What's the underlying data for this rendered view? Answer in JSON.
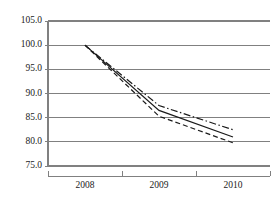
{
  "chart_data": {
    "type": "line",
    "title": "",
    "subtitle": "",
    "xlabel": "",
    "ylabel": "",
    "x": [
      "2008",
      "2009",
      "2010"
    ],
    "categories": [
      "2008",
      "2009",
      "2010"
    ],
    "series": [
      {
        "name": "upper",
        "style": "dash-dot",
        "values": [
          100.0,
          87.5,
          82.5
        ]
      },
      {
        "name": "middle",
        "style": "solid",
        "values": [
          100.0,
          86.5,
          81.0
        ]
      },
      {
        "name": "lower",
        "style": "dashed",
        "values": [
          100.0,
          85.3,
          79.8
        ]
      }
    ],
    "ylim": [
      75.0,
      105.0
    ],
    "ytick_labels": [
      "105.0",
      "100.0",
      "95.0",
      "90.0",
      "85.0",
      "80.0",
      "75.0"
    ],
    "ytick_values": [
      105.0,
      100.0,
      95.0,
      90.0,
      85.0,
      80.0,
      75.0
    ],
    "xtick_labels": [
      "2008",
      "2009",
      "2010"
    ],
    "grid": true,
    "legend": "none",
    "colors": {
      "line": "#1a1a1a",
      "grid": "#808080",
      "axis": "#808080",
      "background": "#ffffff"
    }
  }
}
